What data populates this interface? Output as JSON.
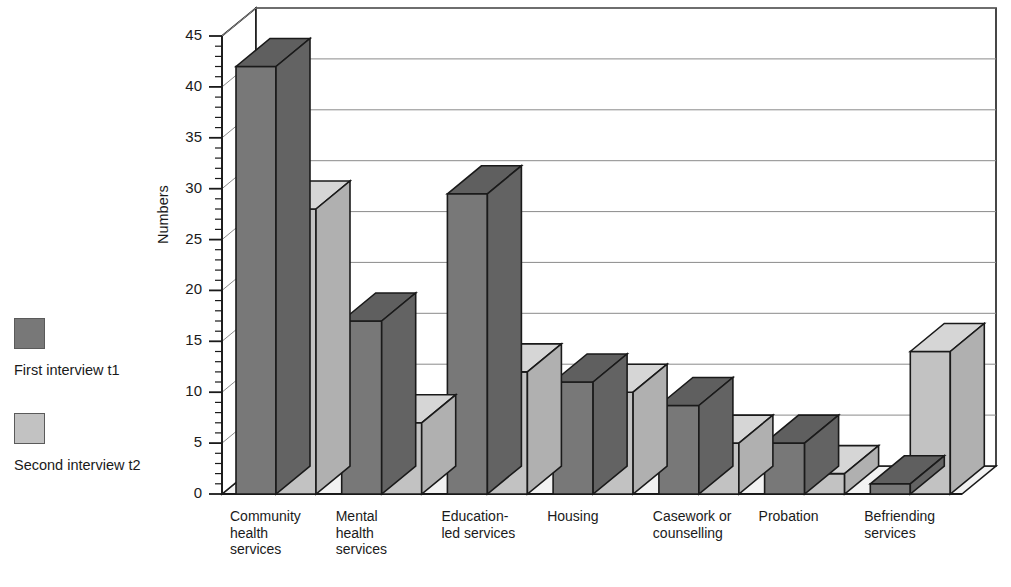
{
  "chart_data": {
    "type": "bar",
    "title": "",
    "subtitle": "",
    "xlabel": "",
    "ylabel": "Numbers",
    "ylim": [
      0,
      45
    ],
    "ytick_step": 5,
    "yminor_step": 1,
    "grid": true,
    "threeD": true,
    "legend_position": "left",
    "categories": [
      "Community health services",
      "Mental health services",
      "Education-led services",
      "Housing",
      "Casework or counselling",
      "Probation",
      "Befriending services"
    ],
    "category_lines": [
      [
        "Community",
        "health",
        "services"
      ],
      [
        "Mental",
        "health",
        "services"
      ],
      [
        "Education-",
        "led services"
      ],
      [
        "Housing"
      ],
      [
        "Casework or",
        "counselling"
      ],
      [
        "Probation"
      ],
      [
        "Befriending",
        "services"
      ]
    ],
    "series": [
      {
        "name": "First interview t1",
        "color": "#787878",
        "values": [
          42,
          17,
          29.5,
          11,
          8.7,
          5,
          1
        ]
      },
      {
        "name": "Second interview t2",
        "color": "#c2c2c2",
        "values": [
          28,
          7,
          12,
          10,
          5,
          2,
          14
        ]
      }
    ],
    "ytick_labels": [
      "0",
      "5",
      "10",
      "15",
      "20",
      "25",
      "30",
      "35",
      "40",
      "45"
    ]
  },
  "legend": {
    "entries": [
      {
        "label": "First interview t1",
        "color": "#787878"
      },
      {
        "label": "Second interview t2",
        "color": "#c2c2c2"
      }
    ]
  },
  "axis": {
    "y_title": "Numbers"
  },
  "colors": {
    "series1_front": "#787878",
    "series1_top": "#5f5f5f",
    "series1_side": "#636363",
    "series2_front": "#c2c2c2",
    "series2_top": "#d6d6d6",
    "series2_side": "#b0b0b0",
    "floor": "#f2f2f2",
    "wall": "#ffffff",
    "gridline": "#8a8a8a",
    "outline": "#1a1a1a",
    "text": "#1a1a1a"
  }
}
